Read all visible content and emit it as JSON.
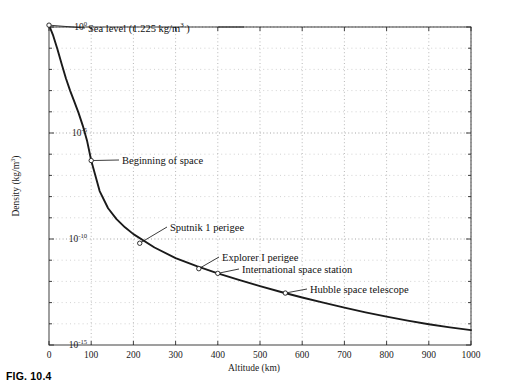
{
  "caption": "FIG. 10.4",
  "chart_data": {
    "type": "line",
    "title": "",
    "xlabel": "Altitude (km)",
    "ylabel": "Density (kg/m",
    "ylabel_sup": "3",
    "ylabel_tail": ")",
    "xlim": [
      0,
      1000
    ],
    "ylim_exp": [
      -15,
      0
    ],
    "yscale": "log",
    "grid": "dotted-minor-and-major",
    "legend": "none",
    "xticks": [
      0,
      100,
      200,
      300,
      400,
      500,
      600,
      700,
      800,
      900,
      1000
    ],
    "xtick_labels": [
      "0",
      "100",
      "200",
      "300",
      "400",
      "500",
      "600",
      "700",
      "800",
      "900",
      "1000"
    ],
    "yticks_exp": [
      0,
      -5,
      -10,
      -15
    ],
    "ytick_mantissa": "10",
    "ytick_exponents": [
      "0",
      "-5",
      "-10",
      "-15"
    ],
    "series": [
      {
        "name": "Atmospheric density",
        "x": [
          0,
          10,
          20,
          30,
          40,
          50,
          60,
          70,
          80,
          90,
          100,
          120,
          140,
          160,
          180,
          200,
          250,
          300,
          350,
          400,
          450,
          500,
          550,
          600,
          650,
          700,
          750,
          800,
          850,
          900,
          950,
          1000
        ],
        "y_exp": [
          0.087,
          -0.41,
          -1.05,
          -1.75,
          -2.42,
          -3.0,
          -3.52,
          -4.05,
          -4.65,
          -5.35,
          -6.3,
          -7.74,
          -8.55,
          -9.06,
          -9.45,
          -9.77,
          -10.4,
          -10.9,
          -11.28,
          -11.62,
          -11.93,
          -12.22,
          -12.5,
          -12.76,
          -13.0,
          -13.24,
          -13.46,
          -13.66,
          -13.85,
          -14.02,
          -14.17,
          -14.3
        ]
      }
    ],
    "annotations": [
      {
        "id": "sea-level",
        "text_pre": "Sea level (1.225 kg",
        "text_slash": "/",
        "text_unit": "m",
        "text_sup": "3",
        "text_post": " )",
        "point_x": 0,
        "point_y_exp": 0.087,
        "label_x": 88,
        "label_y": 28,
        "leader_to_x": 244,
        "leader_to_y": 27,
        "has_long_leader": true
      },
      {
        "id": "beginning-of-space",
        "text": "Beginning of space",
        "point_x": 100,
        "point_y_exp": -6.3,
        "label_x": 122,
        "label_y": 160
      },
      {
        "id": "sputnik-1-perigee",
        "text": "Sputnik 1 perigee",
        "point_x": 215,
        "point_y_exp": -10.2,
        "label_x": 170,
        "label_y": 227
      },
      {
        "id": "explorer-i-perigee",
        "text": "Explorer I perigee",
        "point_x": 355,
        "point_y_exp": -11.4,
        "label_x": 222,
        "label_y": 257
      },
      {
        "id": "international-space-station",
        "text": "International space station",
        "point_x": 400,
        "point_y_exp": -11.62,
        "label_x": 242,
        "label_y": 269
      },
      {
        "id": "hubble-space-telescope",
        "text": "Hubble space telescope",
        "point_x": 560,
        "point_y_exp": -12.55,
        "label_x": 310,
        "label_y": 289
      }
    ]
  }
}
